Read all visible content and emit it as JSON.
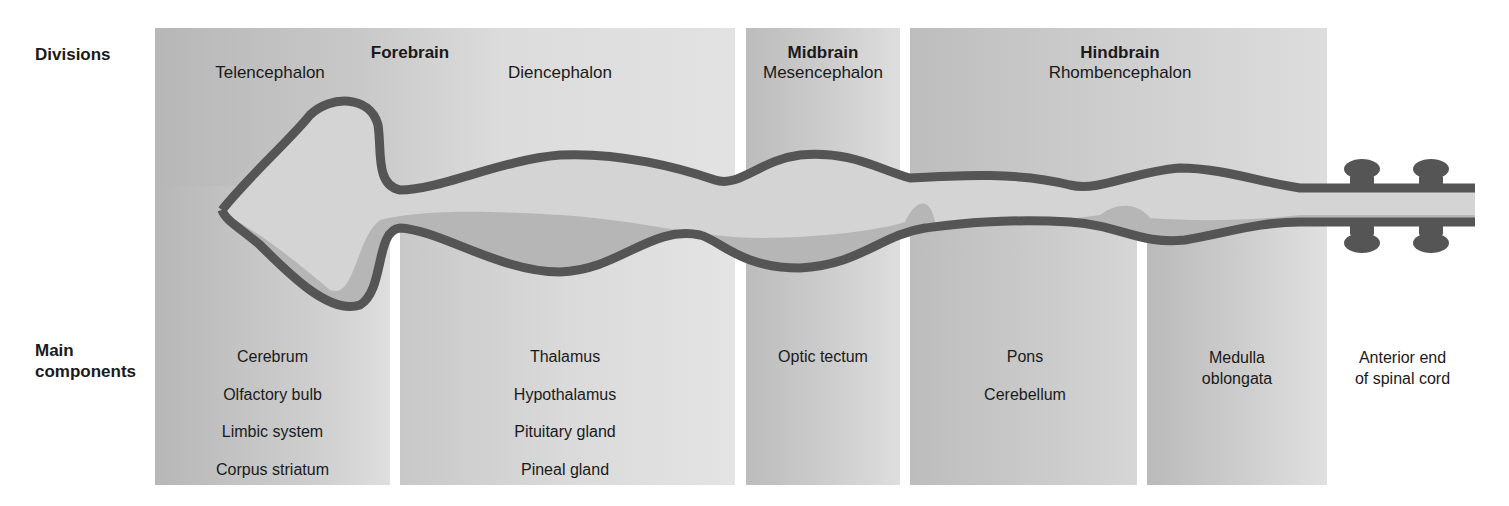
{
  "row_labels": {
    "divisions": "Divisions",
    "main_components_line1": "Main",
    "main_components_line2": "components"
  },
  "divisions": [
    {
      "name": "Forebrain",
      "subdivisions": [
        {
          "name": "Telencephalon",
          "components": [
            "Cerebrum",
            "Olfactory bulb",
            "Limbic system",
            "Corpus striatum"
          ]
        },
        {
          "name": "Diencephalon",
          "components": [
            "Thalamus",
            "Hypothalamus",
            "Pituitary gland",
            "Pineal gland"
          ]
        }
      ]
    },
    {
      "name": "Midbrain",
      "subdivisions": [
        {
          "name": "Mesencephalon",
          "components": [
            "Optic tectum"
          ]
        }
      ]
    },
    {
      "name": "Hindbrain",
      "subdivisions": [
        {
          "name": "Rhombencephalon",
          "components_pons": [
            "Pons",
            "Cerebellum"
          ],
          "components_medulla_line1": "Medulla",
          "components_medulla_line2": "oblongata"
        }
      ]
    }
  ],
  "spinal_cord": {
    "line1": "Anterior end",
    "line2": "of spinal cord"
  },
  "colors": {
    "panel_dark": "#b9b9b9",
    "panel_light": "#dcdcdc",
    "tube_wall": "#555555",
    "tube_lumen": "#d2d2d2",
    "tube_floor": "#b4b4b4",
    "background": "#ffffff"
  }
}
